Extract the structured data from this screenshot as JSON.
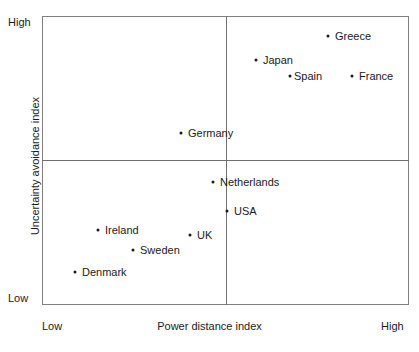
{
  "chart_data": {
    "type": "scatter",
    "title": "",
    "xlabel": "Power distance index",
    "ylabel": "Uncertainty avoidance index",
    "xlim": [
      "Low",
      "High"
    ],
    "ylim": [
      "Low",
      "High"
    ],
    "x_tick_labels": [
      "Low",
      "High"
    ],
    "y_tick_labels": [
      "High",
      "Low"
    ],
    "grid": false,
    "legend": "none",
    "quadrant_lines": {
      "vertical_x_px": 226,
      "horizontal_y_px": 160,
      "note": "Two crossing reference lines split the plot into four quadrants"
    },
    "points": [
      {
        "label": "Greece",
        "px": 328,
        "py": 36,
        "label_dx": 7,
        "x_rel": 0.779,
        "y_rel": 0.931
      },
      {
        "label": "Japan",
        "px": 256,
        "py": 60,
        "label_dx": 7,
        "x_rel": 0.583,
        "y_rel": 0.848
      },
      {
        "label": "Spain",
        "px": 290,
        "py": 76,
        "label_dx": 4,
        "x_rel": 0.676,
        "y_rel": 0.792
      },
      {
        "label": "France",
        "px": 352,
        "py": 76,
        "label_dx": 7,
        "x_rel": 0.845,
        "y_rel": 0.792
      },
      {
        "label": "Germany",
        "px": 181,
        "py": 133,
        "label_dx": 7,
        "x_rel": 0.379,
        "y_rel": 0.595
      },
      {
        "label": "Netherlands",
        "px": 213,
        "py": 182,
        "label_dx": 7,
        "x_rel": 0.466,
        "y_rel": 0.426
      },
      {
        "label": "USA",
        "px": 227,
        "py": 211,
        "label_dx": 7,
        "x_rel": 0.504,
        "y_rel": 0.325
      },
      {
        "label": "Ireland",
        "px": 98,
        "py": 230,
        "label_dx": 7,
        "x_rel": 0.153,
        "y_rel": 0.26
      },
      {
        "label": "UK",
        "px": 190,
        "py": 235,
        "label_dx": 7,
        "x_rel": 0.403,
        "y_rel": 0.242
      },
      {
        "label": "Sweden",
        "px": 133,
        "py": 250,
        "label_dx": 7,
        "x_rel": 0.248,
        "y_rel": 0.19
      },
      {
        "label": "Denmark",
        "px": 75,
        "py": 272,
        "label_dx": 7,
        "x_rel": 0.09,
        "y_rel": 0.114
      }
    ]
  },
  "axes": {
    "y_high_label": "High",
    "y_low_label": "Low",
    "x_low_label": "Low",
    "x_high_label": "High",
    "x_title": "Power distance index",
    "y_title": "Uncertainty avoidance index"
  },
  "colors": {
    "point": "#1a1a1a",
    "frame": "#808080",
    "divider": "#707070",
    "text": "#1a1a1a",
    "background": "#ffffff"
  }
}
